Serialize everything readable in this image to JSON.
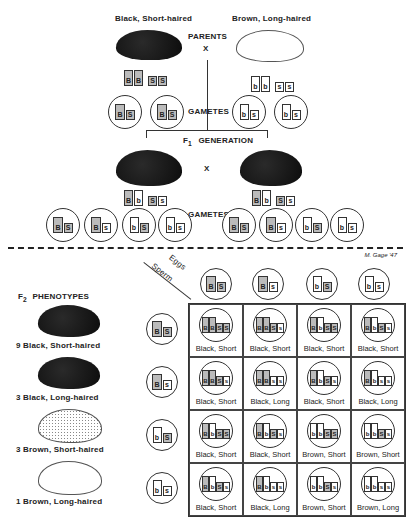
{
  "parents": {
    "left_label": "Black, Short-haired",
    "right_label": "Brown, Long-haired",
    "center_label": "PARENTS",
    "cross": "X",
    "left_genes": [
      {
        "a": "B",
        "dom": true
      },
      {
        "a": "B",
        "dom": true
      },
      {
        "a": "S",
        "dom": true
      },
      {
        "a": "S",
        "dom": true
      }
    ],
    "right_genes": [
      {
        "a": "b",
        "dom": false
      },
      {
        "a": "b",
        "dom": false
      },
      {
        "a": "s",
        "dom": false
      },
      {
        "a": "s",
        "dom": false
      }
    ]
  },
  "gametes_label": "GAMETES",
  "parent_gametes": {
    "left": [
      "BS",
      "BS"
    ],
    "right": [
      "bs",
      "bs"
    ]
  },
  "f1": {
    "label_prefix": "F",
    "label_sub": "1",
    "label": "GENERATION",
    "cross": "X",
    "left_genes": [
      {
        "a": "B",
        "dom": true
      },
      {
        "a": "b",
        "dom": false
      },
      {
        "a": "S",
        "dom": true
      },
      {
        "a": "s",
        "dom": false
      }
    ],
    "right_genes": [
      {
        "a": "B",
        "dom": true
      },
      {
        "a": "b",
        "dom": false
      },
      {
        "a": "S",
        "dom": true
      },
      {
        "a": "s",
        "dom": false
      }
    ]
  },
  "f1_gametes": {
    "left": [
      "BS",
      "Bs",
      "bS",
      "bs"
    ],
    "right": [
      "BS",
      "Bs",
      "bS",
      "bs"
    ]
  },
  "signature": "M. Gage '47",
  "f2": {
    "title_prefix": "F",
    "title_sub": "2",
    "title": "PHENOTYPES",
    "phenotypes": [
      {
        "count": "9",
        "label": "Black, Short-haired",
        "style": "black"
      },
      {
        "count": "3",
        "label": "Black, Long-haired",
        "style": "black"
      },
      {
        "count": "3",
        "label": "Brown, Short-haired",
        "style": "dotted"
      },
      {
        "count": "1",
        "label": "Brown, Long-haired",
        "style": "white"
      }
    ]
  },
  "punnett": {
    "eggs_label": "Eggs",
    "sperm_label": "Sperm",
    "eggs": [
      "BS",
      "Bs",
      "bS",
      "bs"
    ],
    "sperm": [
      "BS",
      "Bs",
      "bS",
      "bs"
    ],
    "cells": [
      [
        {
          "g": "BBSS",
          "p": "Black, Short"
        },
        {
          "g": "BBSs",
          "p": "Black, Short"
        },
        {
          "g": "BbSS",
          "p": "Black, Short"
        },
        {
          "g": "BbSs",
          "p": "Black, Short"
        }
      ],
      [
        {
          "g": "BBSs",
          "p": "Black, Short"
        },
        {
          "g": "BBss",
          "p": "Black, Long"
        },
        {
          "g": "BbSs",
          "p": "Black, Short"
        },
        {
          "g": "Bbss",
          "p": "Black, Long"
        }
      ],
      [
        {
          "g": "BbSS",
          "p": "Black, Short"
        },
        {
          "g": "BbSs",
          "p": "Black, Short"
        },
        {
          "g": "bbSS",
          "p": "Brown, Short"
        },
        {
          "g": "bbSs",
          "p": "Brown, Short"
        }
      ],
      [
        {
          "g": "BbSs",
          "p": "Black, Short"
        },
        {
          "g": "Bbss",
          "p": "Black, Long"
        },
        {
          "g": "bbSs",
          "p": "Brown, Short"
        },
        {
          "g": "bbss",
          "p": "Brown, Long"
        }
      ]
    ]
  }
}
